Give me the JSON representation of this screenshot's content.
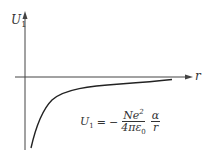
{
  "diagram": {
    "type": "potential-energy-curve",
    "y_axis": {
      "label": "U",
      "subscript": "1"
    },
    "x_axis": {
      "label": "r"
    },
    "curve": {
      "description": "negative 1/r curve approaching zero from below",
      "color": "#222222"
    },
    "formula": {
      "lhs": "U",
      "lhs_sub": "1",
      "equals": "=",
      "sign": "−",
      "frac1_num": "Ne",
      "frac1_num_sup": "2",
      "frac1_den": "4πε",
      "frac1_den_sub": "0",
      "frac2_num": "α",
      "frac2_den": "r"
    },
    "colors": {
      "axis": "#444444",
      "curve": "#222222",
      "text": "#333333",
      "background": "#ffffff"
    }
  }
}
